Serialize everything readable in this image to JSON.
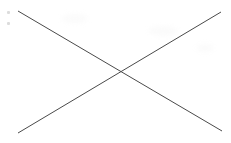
{
  "canvas": {
    "width": 231,
    "height": 143,
    "background_color": "#ffffff",
    "alt_text": "X"
  },
  "figure": {
    "name": "x-mark",
    "description": "X",
    "stroke_color": "#4a4a4a",
    "stroke_width": 1,
    "lines": [
      {
        "name": "diagonal-top-left-to-bottom-right",
        "x1": 18,
        "y1": 11,
        "x2": 222,
        "y2": 131
      },
      {
        "name": "diagonal-bottom-left-to-top-right",
        "x1": 18,
        "y1": 133,
        "x2": 221,
        "y2": 12
      }
    ],
    "intersection": {
      "x": 120,
      "y": 72
    }
  },
  "artifacts": {
    "speck_color": "#dcdcdc",
    "specks": [
      {
        "name": "speck-upper",
        "x": 7,
        "y": 11
      },
      {
        "name": "speck-lower",
        "x": 7,
        "y": 22
      }
    ],
    "smudge_color": "#fbfbfb"
  }
}
